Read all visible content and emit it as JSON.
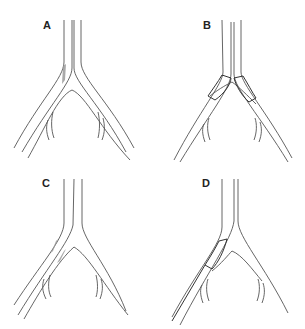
{
  "figure": {
    "panels": [
      {
        "id": "A",
        "label": "A",
        "description": "Bifurcation with lesion at origin of left branch"
      },
      {
        "id": "B",
        "label": "B",
        "description": "Kissing stents placed in both branch origins"
      },
      {
        "id": "C",
        "label": "C",
        "description": "Bifurcation with lesions on left branch and carina"
      },
      {
        "id": "D",
        "label": "D",
        "description": "Single stent placed in left branch origin"
      }
    ],
    "colors": {
      "line": "#555555",
      "lesion": "#9a9a9a",
      "stent": "#333333",
      "background": "#ffffff"
    }
  }
}
